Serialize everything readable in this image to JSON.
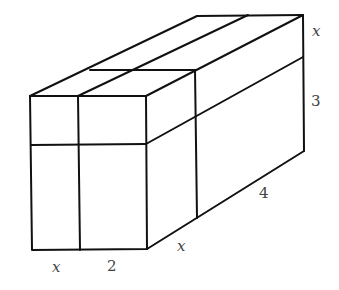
{
  "diagram": {
    "type": "3d-box-dimensions",
    "labels": {
      "front_width_x": "x",
      "front_width_2": "2",
      "depth_x": "x",
      "depth_4": "4",
      "height_x": "x",
      "height_3": "3"
    },
    "colors": {
      "stroke": "#111111",
      "label": "#444444",
      "background": "#ffffff"
    }
  }
}
